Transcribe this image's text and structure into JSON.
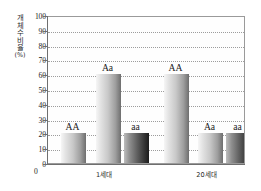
{
  "chart_data": {
    "type": "bar",
    "title": "",
    "xlabel": "",
    "ylabel": "개체 수 비율 (%)",
    "ylabel_chars": [
      "개",
      "체",
      "수",
      "비",
      "율",
      "(%)"
    ],
    "ylim": [
      0,
      100
    ],
    "ytick_values": [
      0,
      10,
      20,
      30,
      40,
      50,
      60,
      70,
      80,
      90,
      100
    ],
    "ytick_labels": [
      "0",
      "10",
      "20",
      "30",
      "40",
      "50",
      "60",
      "70",
      "80",
      "90",
      "100"
    ],
    "grid": true,
    "grid_style": "dotted-horizontal",
    "legend": "none",
    "categories": [
      "1세대",
      "20세대"
    ],
    "series": [
      {
        "name": "AA",
        "values": [
          20,
          60
        ]
      },
      {
        "name": "Aa",
        "values": [
          60,
          20
        ]
      },
      {
        "name": "aa",
        "values": [
          20,
          20
        ]
      }
    ],
    "bars": [
      {
        "group": "1세대",
        "genotype": "AA",
        "value": 20,
        "shade": "light"
      },
      {
        "group": "1세대",
        "genotype": "Aa",
        "value": 60,
        "shade": "light"
      },
      {
        "group": "1세대",
        "genotype": "aa",
        "value": 20,
        "shade": "dark"
      },
      {
        "group": "20세대",
        "genotype": "AA",
        "value": 60,
        "shade": "light"
      },
      {
        "group": "20세대",
        "genotype": "Aa",
        "value": 20,
        "shade": "light"
      },
      {
        "group": "20세대",
        "genotype": "aa",
        "value": 20,
        "shade": "dark"
      }
    ],
    "origin_label": "0",
    "colors": {
      "frame": "#9a9a9a",
      "axis": "#6f6f6f",
      "grid": "#9d9d9d",
      "text": "#1a1a1a",
      "plot_background": "#fefefe"
    }
  }
}
